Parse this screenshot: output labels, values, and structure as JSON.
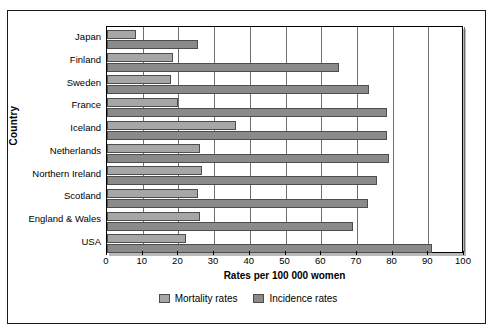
{
  "chart_data": {
    "type": "bar",
    "orientation": "horizontal",
    "title": "",
    "xlabel": "Rates per 100 000  women",
    "ylabel": "Country",
    "xlim": [
      0,
      100
    ],
    "xticks": [
      0,
      10,
      20,
      30,
      40,
      50,
      60,
      70,
      80,
      90,
      100
    ],
    "grid": "vertical",
    "legend_position": "bottom-center",
    "categories": [
      "Japan",
      "Finland",
      "Sweden",
      "France",
      "Iceland",
      "Netherlands",
      "Northern Ireland",
      "Scotland",
      "England & Wales",
      "USA"
    ],
    "series": [
      {
        "name": "Mortality rates",
        "color": "#a6a6a6",
        "values": [
          8,
          18.5,
          18,
          20,
          36,
          26,
          26.5,
          25.5,
          26,
          22
        ]
      },
      {
        "name": "Incidence rates",
        "color": "#8a8a8a",
        "values": [
          25.5,
          65,
          73.5,
          78.5,
          78.5,
          79,
          75.5,
          73,
          69,
          91
        ]
      }
    ]
  },
  "legend": {
    "items": [
      {
        "label": "Mortality rates",
        "swatch": "mortality"
      },
      {
        "label": "Incidence rates",
        "swatch": "incidence"
      }
    ]
  }
}
